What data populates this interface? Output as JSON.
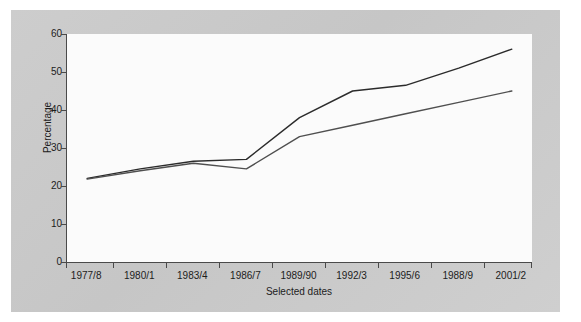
{
  "chart_data": {
    "type": "line",
    "title": "",
    "xlabel": "Selected dates",
    "ylabel": "Percentage",
    "categories": [
      "1977/8",
      "1980/1",
      "1983/4",
      "1986/7",
      "1989/90",
      "1992/3",
      "1995/6",
      "1988/9",
      "2001/2"
    ],
    "yticks": [
      0,
      10,
      20,
      30,
      40,
      50,
      60
    ],
    "ylim": [
      0,
      60
    ],
    "grid": false,
    "legend": "none",
    "series": [
      {
        "name": "upper-line",
        "color": "#2b2b2b",
        "values": [
          22,
          24.5,
          26.5,
          27,
          38,
          45,
          46.5,
          51,
          56
        ]
      },
      {
        "name": "lower-line",
        "color": "#4f4f4f",
        "values": [
          21.8,
          24,
          26,
          24.5,
          33,
          36,
          39,
          42,
          45
        ]
      }
    ]
  },
  "figure": {
    "background_color": "#c9c9c9",
    "plot_background_color": "#fbfbfb",
    "axis_color": "#4a4a4a"
  }
}
